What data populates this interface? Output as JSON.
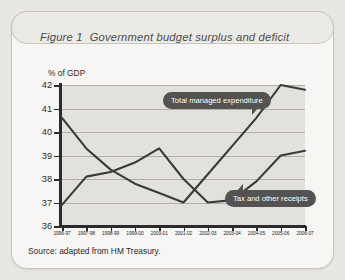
{
  "figure": {
    "label": "Figure 1",
    "title": "Government budget surplus and deficit",
    "source": "Source: adapted from HM Treasury."
  },
  "callouts": {
    "expenditure": "Total managed expenditure",
    "receipts": "Tax and other receipts"
  },
  "chart_data": {
    "type": "line",
    "title": "Government budget surplus and deficit",
    "xlabel": "",
    "ylabel": "% of GDP",
    "ylim": [
      36,
      42
    ],
    "yticks": [
      36,
      37,
      38,
      39,
      40,
      41,
      42
    ],
    "grid": true,
    "legend_position": "inline-callouts",
    "categories": [
      "1996-97",
      "1997-98",
      "1998-99",
      "1999-00",
      "2000-01",
      "2001-02",
      "2002-03",
      "2003-04",
      "2004-05",
      "2005-06",
      "2006-07"
    ],
    "series": [
      {
        "name": "Total managed expenditure",
        "color": "#3a3a3a",
        "values": [
          40.6,
          39.3,
          38.4,
          37.8,
          37.4,
          37.0,
          38.2,
          39.4,
          40.6,
          42.0,
          41.8
        ]
      },
      {
        "name": "Tax and other receipts",
        "color": "#3a3a3a",
        "values": [
          36.9,
          38.1,
          38.3,
          38.7,
          39.3,
          38.0,
          37.0,
          37.1,
          37.9,
          39.0,
          39.2
        ]
      }
    ],
    "annotations": [
      {
        "text": "Total managed expenditure",
        "target_series": "Total managed expenditure"
      },
      {
        "text": "Tax and other receipts",
        "target_series": "Tax and other receipts"
      }
    ]
  }
}
